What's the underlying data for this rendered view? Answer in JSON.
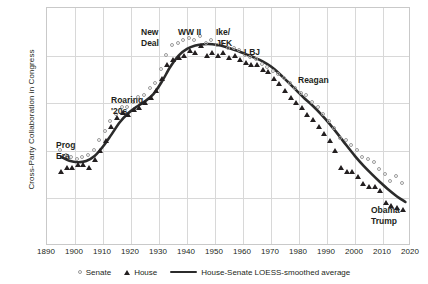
{
  "chart_data": {
    "type": "scatter",
    "title": "",
    "xlabel": "",
    "ylabel": "Cross-Party Collaboration in Congress",
    "xlim": [
      1890,
      2020
    ],
    "ylim": [
      0,
      1
    ],
    "grid": true,
    "legend_position": "bottom",
    "xticks": [
      1890,
      1900,
      1910,
      1920,
      1930,
      1940,
      1950,
      1960,
      1970,
      1980,
      1990,
      2000,
      2010,
      2020
    ],
    "yticks": [],
    "series": [
      {
        "name": "Senate",
        "marker": "open-circle",
        "color": "#9a9a9a",
        "x": [
          1895,
          1897,
          1899,
          1901,
          1903,
          1905,
          1907,
          1909,
          1911,
          1913,
          1915,
          1917,
          1919,
          1921,
          1923,
          1925,
          1927,
          1929,
          1931,
          1933,
          1935,
          1937,
          1939,
          1941,
          1943,
          1945,
          1947,
          1949,
          1951,
          1953,
          1955,
          1957,
          1959,
          1961,
          1963,
          1965,
          1967,
          1969,
          1971,
          1973,
          1975,
          1977,
          1979,
          1981,
          1983,
          1985,
          1987,
          1989,
          1991,
          1993,
          1995,
          1997,
          1999,
          2001,
          2003,
          2005,
          2007,
          2009,
          2011,
          2013,
          2015,
          2017
        ],
        "y": [
          0.4,
          0.38,
          0.37,
          0.36,
          0.37,
          0.38,
          0.4,
          0.44,
          0.48,
          0.52,
          0.55,
          0.58,
          0.58,
          0.6,
          0.62,
          0.63,
          0.66,
          0.68,
          0.74,
          0.8,
          0.84,
          0.85,
          0.86,
          0.87,
          0.86,
          0.88,
          0.85,
          0.86,
          0.84,
          0.85,
          0.83,
          0.83,
          0.82,
          0.8,
          0.79,
          0.78,
          0.76,
          0.75,
          0.73,
          0.72,
          0.7,
          0.68,
          0.66,
          0.64,
          0.63,
          0.6,
          0.58,
          0.55,
          0.52,
          0.49,
          0.45,
          0.44,
          0.42,
          0.4,
          0.37,
          0.36,
          0.35,
          0.32,
          0.3,
          0.27,
          0.29,
          0.26
        ]
      },
      {
        "name": "House",
        "marker": "filled-triangle",
        "color": "#231f20",
        "x": [
          1895,
          1897,
          1899,
          1901,
          1903,
          1905,
          1907,
          1909,
          1911,
          1913,
          1915,
          1917,
          1919,
          1921,
          1923,
          1925,
          1927,
          1929,
          1931,
          1933,
          1935,
          1937,
          1939,
          1941,
          1943,
          1945,
          1947,
          1949,
          1951,
          1953,
          1955,
          1957,
          1959,
          1961,
          1963,
          1965,
          1967,
          1969,
          1971,
          1973,
          1975,
          1977,
          1979,
          1981,
          1983,
          1985,
          1987,
          1989,
          1991,
          1993,
          1995,
          1997,
          1999,
          2001,
          2003,
          2005,
          2007,
          2009,
          2011,
          2013,
          2015,
          2017
        ],
        "y": [
          0.31,
          0.33,
          0.33,
          0.34,
          0.34,
          0.33,
          0.36,
          0.4,
          0.44,
          0.5,
          0.54,
          0.56,
          0.55,
          0.57,
          0.58,
          0.6,
          0.62,
          0.65,
          0.7,
          0.76,
          0.78,
          0.79,
          0.8,
          0.82,
          0.81,
          0.84,
          0.8,
          0.81,
          0.8,
          0.81,
          0.79,
          0.8,
          0.78,
          0.77,
          0.76,
          0.76,
          0.74,
          0.73,
          0.7,
          0.68,
          0.65,
          0.62,
          0.6,
          0.58,
          0.55,
          0.53,
          0.5,
          0.47,
          0.44,
          0.4,
          0.33,
          0.31,
          0.31,
          0.29,
          0.26,
          0.25,
          0.25,
          0.23,
          0.18,
          0.17,
          0.16,
          0.15
        ]
      }
    ],
    "trend": {
      "name": "House-Senate LOESS-smoothed average",
      "color": "#2b2b2b",
      "x": [
        1895,
        1898,
        1901,
        1904,
        1907,
        1910,
        1913,
        1916,
        1919,
        1922,
        1925,
        1928,
        1931,
        1934,
        1937,
        1940,
        1943,
        1946,
        1949,
        1952,
        1955,
        1958,
        1961,
        1964,
        1967,
        1970,
        1973,
        1976,
        1979,
        1982,
        1985,
        1988,
        1991,
        1994,
        1997,
        2000,
        2003,
        2006,
        2009,
        2012,
        2015,
        2018
      ],
      "y": [
        0.375,
        0.358,
        0.352,
        0.357,
        0.378,
        0.418,
        0.468,
        0.52,
        0.558,
        0.585,
        0.608,
        0.638,
        0.69,
        0.752,
        0.8,
        0.828,
        0.842,
        0.848,
        0.848,
        0.842,
        0.832,
        0.82,
        0.806,
        0.792,
        0.776,
        0.754,
        0.724,
        0.69,
        0.655,
        0.62,
        0.588,
        0.552,
        0.512,
        0.468,
        0.422,
        0.378,
        0.338,
        0.302,
        0.268,
        0.236,
        0.208,
        0.185
      ]
    },
    "annotations": [
      {
        "label": "Prog\nEra",
        "name": "progressive-era",
        "x_px": 55,
        "y_px": 139,
        "align": "left"
      },
      {
        "label": "Roaring\n'20s",
        "name": "roaring-twenties",
        "x_px": 110,
        "y_px": 94,
        "align": "left"
      },
      {
        "label": "New\nDeal",
        "name": "new-deal",
        "x_px": 140,
        "y_px": 26,
        "align": "left"
      },
      {
        "label": "WW II",
        "name": "world-war-two",
        "x_px": 177,
        "y_px": 26,
        "align": "left"
      },
      {
        "label": "Ike/\nJFK",
        "name": "ike-jfk",
        "x_px": 215,
        "y_px": 26,
        "align": "left"
      },
      {
        "label": "LBJ",
        "name": "lbj",
        "x_px": 243,
        "y_px": 46,
        "align": "left"
      },
      {
        "label": "Reagan",
        "name": "reagan",
        "x_px": 297,
        "y_px": 74,
        "align": "left"
      },
      {
        "label": "Obama",
        "name": "obama",
        "x_px": 370,
        "y_px": 204,
        "align": "left"
      },
      {
        "label": "Trump",
        "name": "trump",
        "x_px": 370,
        "y_px": 215,
        "align": "left"
      }
    ]
  },
  "legend": {
    "senate_label": "Senate",
    "house_label": "House",
    "trend_label": "House-Senate LOESS-smoothed average"
  }
}
